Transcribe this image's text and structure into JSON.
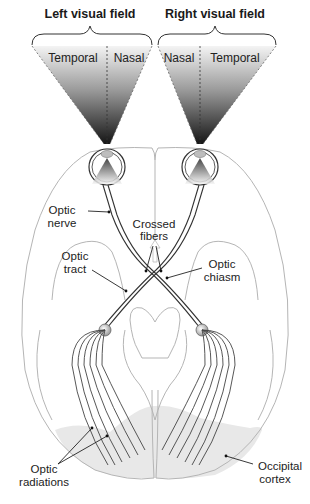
{
  "figure": {
    "title_left": "Left visual field",
    "title_right": "Right visual field",
    "left_field": {
      "outer": "Temporal",
      "inner": "Nasal"
    },
    "right_field": {
      "inner": "Nasal",
      "outer": "Temporal"
    },
    "labels": {
      "optic_nerve_1": "Optic",
      "optic_nerve_2": "nerve",
      "crossed_fibers_1": "Crossed",
      "crossed_fibers_2": "fibers",
      "optic_tract_1": "Optic",
      "optic_tract_2": "tract",
      "optic_chiasm_1": "Optic",
      "optic_chiasm_2": "chiasm",
      "optic_radiations_1": "Optic",
      "optic_radiations_2": "radiations",
      "occipital_cortex_1": "Occipital",
      "occipital_cortex_2": "cortex"
    },
    "colors": {
      "cone_dark": "#1a1a1a",
      "cone_light": "#f2f2f2",
      "brain_outline": "#b5b5b5",
      "occipital_shade": "#e6e6e6",
      "nerve": "#333333"
    }
  }
}
